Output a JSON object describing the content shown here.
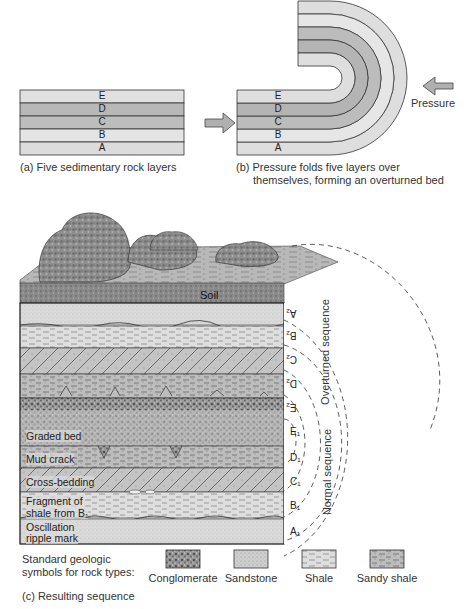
{
  "panel_a": {
    "caption": "(a) Five sedimentary rock layers",
    "layers": [
      "E",
      "D",
      "C",
      "B",
      "A"
    ]
  },
  "panel_b": {
    "caption_line1": "(b) Pressure folds five layers over",
    "caption_line2": "themselves, forming an overturned bed",
    "layers": [
      "E",
      "D",
      "C",
      "B",
      "A"
    ],
    "pressure_label": "Pressure"
  },
  "panel_c": {
    "caption": "(c) Resulting sequence",
    "soil_label": "Soil",
    "overturned_labels": [
      "A₂",
      "B₂",
      "C₂",
      "D₂",
      "E₂"
    ],
    "normal_labels": [
      "E₁",
      "D₁",
      "C₁",
      "B₁",
      "A₁"
    ],
    "overturned_sequence_label": "Overturned sequence",
    "normal_sequence_label": "Normal sequence",
    "annotations": {
      "graded_bed": "Graded bed",
      "mud_crack": "Mud crack",
      "cross_bedding": "Cross-bedding",
      "fragment_line1": "Fragment of",
      "fragment_line2": "shale from B₁",
      "oscillation_line1": "Oscillation",
      "oscillation_line2": "ripple mark"
    }
  },
  "legend": {
    "title_line1": "Standard geologic",
    "title_line2": "symbols for rock types:",
    "items": [
      {
        "label": "Conglomerate",
        "symbol": "conglomerate"
      },
      {
        "label": "Sandstone",
        "symbol": "sandstone"
      },
      {
        "label": "Shale",
        "symbol": "shale"
      },
      {
        "label": "Sandy shale",
        "symbol": "sandy-shale"
      }
    ]
  },
  "colors": {
    "layer_light": "#e4e4e4",
    "layer_dark": "#b8b8b8",
    "outline": "#333333",
    "arrow_fill": "#b0b0b0"
  }
}
